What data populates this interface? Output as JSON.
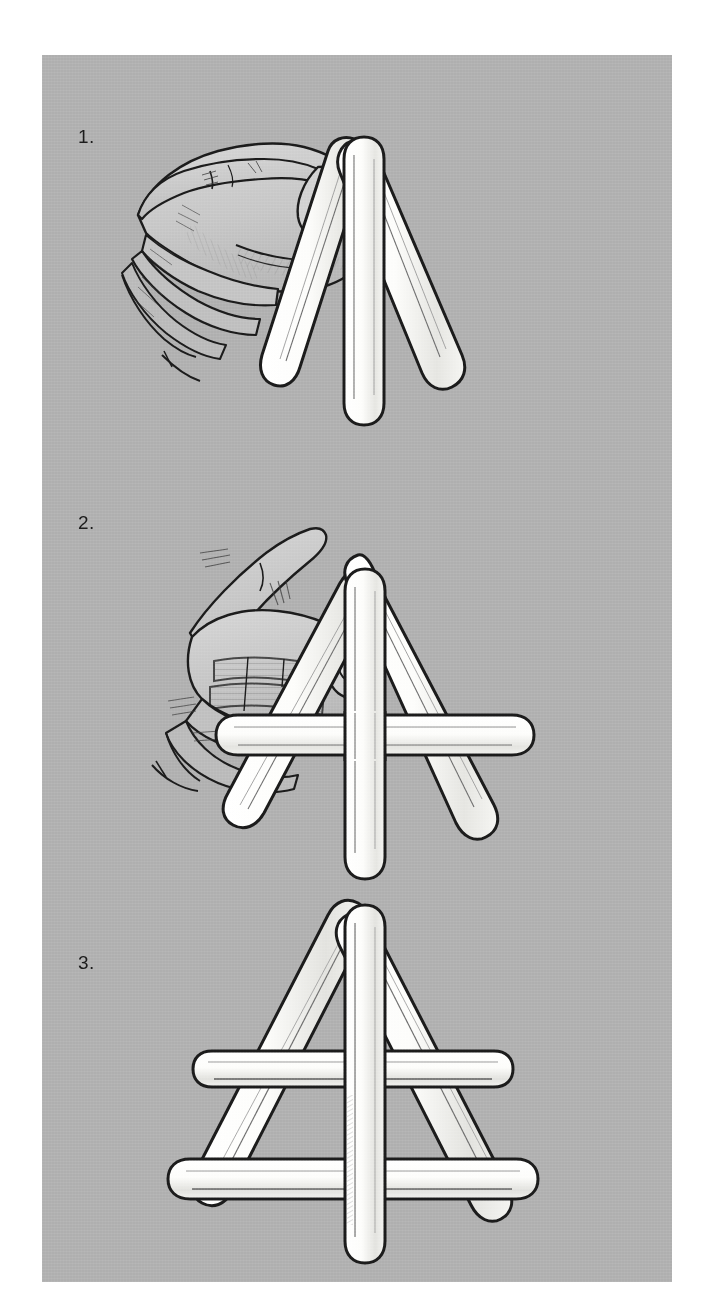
{
  "document": {
    "type": "instructional-illustration",
    "title": "Craft stick A-frame assembly",
    "background_color": "#ffffff",
    "plate_color": "#b0b0b0",
    "ink_color": "#1b1b1b",
    "stick_fill_color": "#fdfdfb",
    "skin_fill_color": "#c9c9c9"
  },
  "panels": [
    {
      "id": "panel-1",
      "step_label": "1.",
      "caption": "",
      "scene": "hand-pinching-three-sticks",
      "objects": {
        "hand": {
          "visible": true,
          "pose": "thumb-and-finger-pinch",
          "side": "left"
        },
        "sticks": [
          {
            "name": "left-leg-stick",
            "orientation": "diagonal-down-left"
          },
          {
            "name": "center-stick",
            "orientation": "vertical"
          },
          {
            "name": "right-leg-stick",
            "orientation": "diagonal-down-right"
          }
        ],
        "crossbars": []
      }
    },
    {
      "id": "panel-2",
      "step_label": "2.",
      "caption": "",
      "scene": "hand-holding-frame-with-one-crossbar",
      "objects": {
        "hand": {
          "visible": true,
          "pose": "thumb-and-finger-pinch",
          "side": "left"
        },
        "sticks": [
          {
            "name": "left-leg-stick",
            "orientation": "diagonal-down-left"
          },
          {
            "name": "center-stick",
            "orientation": "vertical"
          },
          {
            "name": "right-leg-stick",
            "orientation": "diagonal-down-right"
          }
        ],
        "crossbars": [
          {
            "name": "upper-crossbar",
            "orientation": "horizontal"
          }
        ]
      }
    },
    {
      "id": "panel-3",
      "step_label": "3.",
      "caption": "",
      "scene": "finished-a-frame",
      "objects": {
        "hand": {
          "visible": false
        },
        "sticks": [
          {
            "name": "left-leg-stick",
            "orientation": "diagonal-down-left"
          },
          {
            "name": "center-stick",
            "orientation": "vertical"
          },
          {
            "name": "right-leg-stick",
            "orientation": "diagonal-down-right"
          }
        ],
        "crossbars": [
          {
            "name": "upper-crossbar",
            "orientation": "horizontal"
          },
          {
            "name": "lower-crossbar",
            "orientation": "horizontal"
          }
        ]
      }
    }
  ]
}
